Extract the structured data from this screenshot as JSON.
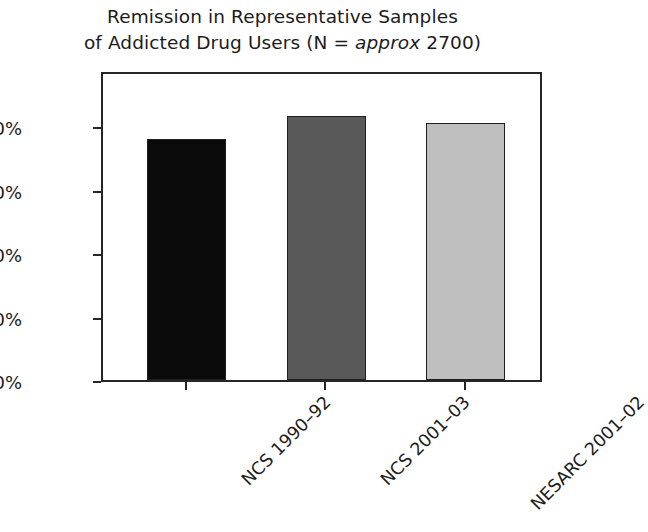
{
  "chart_data": {
    "type": "bar",
    "title": "Remission in Representative Samples of Addicted Drug Users (N = approx 2700)",
    "title_line_1": "Remission in Representative Samples",
    "title_line_2_pre": "of Addicted Drug Users (N = ",
    "title_line_2_italic": "approx",
    "title_line_2_post": " 2700)",
    "categories": [
      "NCS 1990–92",
      "NCS 2001–03",
      "NESARC 2001–02"
    ],
    "values": [
      76,
      83,
      81
    ],
    "value_labels": [
      "76%",
      "83%",
      "81%"
    ],
    "bar_colors": [
      "#0a0a0a",
      "#595959",
      "#bfbfbf"
    ],
    "xlabel": "",
    "ylabel": "% Cases Remitted",
    "ylim": [
      0,
      98
    ],
    "ytick_values": [
      0,
      20,
      40,
      60,
      80
    ],
    "ytick_labels": [
      "0%",
      "20%",
      "40%",
      "60%",
      "80%"
    ],
    "grid": false,
    "legend": false,
    "legend_position": "none",
    "axis_color": "#262626",
    "background_color": "#ffffff"
  }
}
